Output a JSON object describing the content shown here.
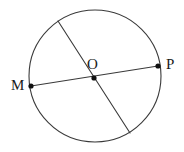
{
  "figure": {
    "type": "geometry-diagram",
    "background_color": "#ffffff",
    "stroke_color": "#3a3a3a",
    "point_color": "#111111",
    "label_color": "#1a1a1a",
    "width": 184,
    "height": 152
  },
  "circle": {
    "name": "main-circle",
    "cx": 95,
    "cy": 76,
    "r": 66,
    "stroke_width": 1.1
  },
  "points": [
    {
      "id": "M",
      "label": "M",
      "x": 31,
      "y": 86,
      "dot_r": 2.6
    },
    {
      "id": "O",
      "label": "O",
      "x": 94,
      "y": 78,
      "dot_r": 2.6
    },
    {
      "id": "P",
      "label": "P",
      "x": 158,
      "y": 66,
      "dot_r": 2.6
    }
  ],
  "segments": [
    {
      "id": "diameter-MP",
      "label": "MP",
      "x1": 31,
      "y1": 86,
      "x2": 158,
      "y2": 66,
      "stroke_width": 1.1
    },
    {
      "id": "chord-secondary",
      "label": "",
      "x1": 58,
      "y1": 21,
      "x2": 130,
      "y2": 133,
      "stroke_width": 1.1
    }
  ],
  "labels": {
    "M": "M",
    "O": "O",
    "P": "P"
  }
}
